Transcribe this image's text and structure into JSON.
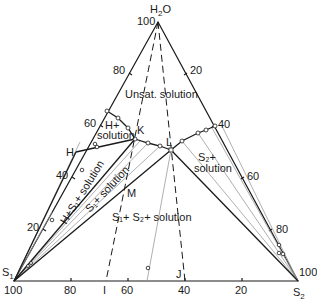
{
  "diagram": {
    "type": "ternary-phase-diagram",
    "vertices": {
      "top": {
        "label": "H",
        "sub": "2",
        "suffix": "O"
      },
      "left": {
        "label": "S",
        "sub": "1"
      },
      "right": {
        "label": "S",
        "sub": "2"
      }
    },
    "left_axis_ticks": [
      "100",
      "80",
      "60",
      "40",
      "20"
    ],
    "right_axis_ticks": [
      "20",
      "40",
      "60",
      "80",
      "100"
    ],
    "bottom_axis_ticks": [
      "100",
      "80",
      "60",
      "40",
      "20"
    ],
    "region_labels": {
      "unsat": "Unsat. solution",
      "h_plus": "H+",
      "h_solution": "solution",
      "h_s1": "H+S₁+ solution",
      "s1": "S₁+ solution",
      "s2_plus": "S₂+",
      "s2_solution": "solution",
      "s1_s2": "S₁+ S₂+ solution"
    },
    "point_labels": {
      "K": "K",
      "L": "L",
      "H": "H",
      "M": "M",
      "I": "I",
      "J": "J"
    }
  }
}
